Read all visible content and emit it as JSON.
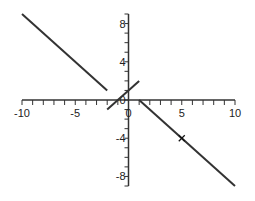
{
  "chart_data": {
    "type": "line",
    "title": "",
    "xlabel": "",
    "ylabel": "",
    "xlim": [
      -10,
      10
    ],
    "ylim": [
      -9,
      9
    ],
    "grid": false,
    "legend": null,
    "x_ticks": [
      -10,
      -5,
      0,
      5,
      10
    ],
    "x_tick_labels": [
      "-10",
      "-5",
      "0",
      "5",
      "10"
    ],
    "y_ticks": [
      -8,
      -4,
      0,
      4,
      8
    ],
    "y_tick_labels": [
      "-8",
      "-4",
      "0",
      "4",
      "8"
    ],
    "series": [
      {
        "name": "segment-left",
        "x": [
          -10,
          -2
        ],
        "y": [
          9,
          1
        ]
      },
      {
        "name": "segment-middle",
        "x": [
          -2,
          1
        ],
        "y": [
          -1,
          2
        ]
      },
      {
        "name": "segment-right",
        "x": [
          1,
          10
        ],
        "y": [
          0,
          -9
        ]
      }
    ],
    "annotations": [
      {
        "type": "marker",
        "symbol": "x",
        "x": 5,
        "y": -4
      }
    ],
    "line_color": "#333333"
  }
}
